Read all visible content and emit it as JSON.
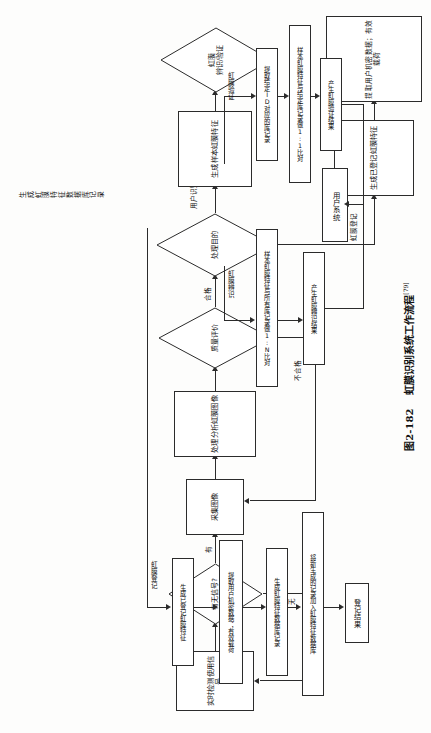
{
  "figure": {
    "number": "图2-182",
    "title": "虹膜识别系统工作流程",
    "reference": "[79]"
  },
  "flowchart": {
    "type": "flowchart",
    "orientation": "rotated-90-ccw",
    "nodes": {
      "detect_signal": "实时检测使用信号",
      "signal_decision": "有无信号?",
      "capture_image": "采集图像",
      "process_analyze": "处理分析虹膜图像",
      "quality_decision": "质量评价",
      "purpose_decision": "处理目的",
      "gen_sample_feature": "生成样本虹膜特征",
      "mode_decision": "虹膜\n辨识/验证",
      "verify_extract_record": "提取给定ID对应的库记录",
      "verify_compare": "样本虹膜特征与给定库记录做1:1比对",
      "verify_result": "产生虹膜验证结果",
      "identify_compare": "样本虹膜特征与所有库记录做1:N比对",
      "identify_result": "产生虹膜辨识结果",
      "user_system": "用户系统",
      "gen_enrolled_feature": "生成已登记虹膜特征",
      "extract_user_data": "提取用户机密数据；有效载荷",
      "gen_db_record": "生成虹膜特征数据库记录",
      "add_to_db": "将新生成的记录加入虹膜特征数据库",
      "enroll_result": "登记结果"
    },
    "edge_labels": {
      "has_signal": "有",
      "no_signal": "无",
      "qualified": "合格",
      "unqualified": "不合格",
      "user_identification": "用户识别",
      "iris_enrollment": "虹膜登记",
      "iris_verification": "虹膜验证",
      "iris_identification": "虹膜辨识"
    }
  },
  "colors": {
    "stroke": "#2b2b2b",
    "text": "#111111",
    "background": "#ffffff"
  }
}
